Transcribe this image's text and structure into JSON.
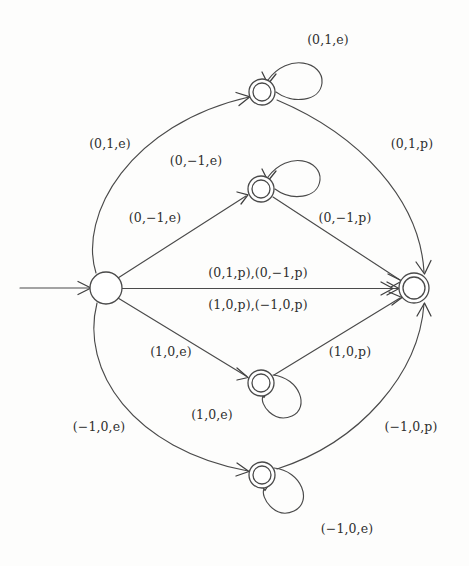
{
  "diagram": {
    "type": "state-transition-diagram",
    "colors": {
      "stroke": "#4a4a4a",
      "text": "#2f2f2f",
      "background": "#fdfdfc"
    },
    "states": [
      {
        "id": "q0",
        "name": "start-state",
        "shape": "single-circle",
        "accepting": false,
        "cx": 106,
        "cy": 288,
        "r": 16
      },
      {
        "id": "q_up2",
        "name": "state-top",
        "shape": "double-circle",
        "accepting": true,
        "cx": 262,
        "cy": 92,
        "r": 13
      },
      {
        "id": "q_up1",
        "name": "state-upper-middle",
        "shape": "double-circle",
        "accepting": true,
        "cx": 261,
        "cy": 189,
        "r": 13
      },
      {
        "id": "q_low1",
        "name": "state-lower-middle",
        "shape": "double-circle",
        "accepting": true,
        "cx": 261,
        "cy": 383,
        "r": 13
      },
      {
        "id": "q_low2",
        "name": "state-bottom",
        "shape": "double-circle",
        "accepting": true,
        "cx": 262,
        "cy": 475,
        "r": 13
      },
      {
        "id": "qf",
        "name": "state-final-right",
        "shape": "double-circle",
        "accepting": true,
        "cx": 414,
        "cy": 288,
        "r": 15
      }
    ],
    "labels": {
      "loop_top": "(0,1,e)",
      "arc_top_left": "(0,1,e)",
      "arc_top_right": "(0,1,p)",
      "loop_upper_middle": "(0,−1,e)",
      "edge_up_in": "(0,−1,e)",
      "edge_up_out": "(0,−1,p)",
      "center_upper": "(0,1,p),(0,−1,p)",
      "center_lower": "(1,0,p),(−1,0,p)",
      "edge_low_in": "(1,0,e)",
      "edge_low_out": "(1,0,p)",
      "loop_lower_middle": "(1,0,e)",
      "arc_bottom_left": "(−1,0,e)",
      "arc_bottom_right": "(−1,0,p)",
      "loop_bottom": "(−1,0,e)"
    },
    "label_positions": [
      {
        "key": "loop_top",
        "name": "label-loop-top",
        "x": 328,
        "y": 44,
        "anchor": "middle"
      },
      {
        "key": "arc_top_left",
        "name": "label-arc-top-left",
        "x": 110,
        "y": 148,
        "anchor": "middle"
      },
      {
        "key": "arc_top_right",
        "name": "label-arc-top-right",
        "x": 412,
        "y": 148,
        "anchor": "middle"
      },
      {
        "key": "loop_upper_middle",
        "name": "label-loop-upper-middle",
        "x": 196,
        "y": 165,
        "anchor": "middle"
      },
      {
        "key": "edge_up_in",
        "name": "label-edge-upper-in",
        "x": 155,
        "y": 222,
        "anchor": "middle"
      },
      {
        "key": "edge_up_out",
        "name": "label-edge-upper-out",
        "x": 345,
        "y": 222,
        "anchor": "middle"
      },
      {
        "key": "center_upper",
        "name": "label-center-upper",
        "x": 258,
        "y": 277,
        "anchor": "middle"
      },
      {
        "key": "center_lower",
        "name": "label-center-lower",
        "x": 258,
        "y": 308,
        "anchor": "middle"
      },
      {
        "key": "edge_low_in",
        "name": "label-edge-lower-in",
        "x": 171,
        "y": 356,
        "anchor": "middle"
      },
      {
        "key": "edge_low_out",
        "name": "label-edge-lower-out",
        "x": 350,
        "y": 356,
        "anchor": "middle"
      },
      {
        "key": "loop_lower_middle",
        "name": "label-loop-lower-middle",
        "x": 212,
        "y": 419,
        "anchor": "middle"
      },
      {
        "key": "arc_bottom_left",
        "name": "label-arc-bottom-left",
        "x": 99,
        "y": 431,
        "anchor": "middle"
      },
      {
        "key": "arc_bottom_right",
        "name": "label-arc-bottom-right",
        "x": 411,
        "y": 431,
        "anchor": "middle"
      },
      {
        "key": "loop_bottom",
        "name": "label-loop-bottom",
        "x": 347,
        "y": 533,
        "anchor": "middle"
      }
    ],
    "transitions": [
      {
        "name": "edge-start-to-top",
        "from": "q0",
        "to": "q_up2",
        "label_key": "arc_top_left"
      },
      {
        "name": "edge-top-to-final",
        "from": "q_up2",
        "to": "qf",
        "label_key": "arc_top_right"
      },
      {
        "name": "selfloop-top",
        "from": "q_up2",
        "to": "q_up2",
        "label_key": "loop_top"
      },
      {
        "name": "edge-start-to-upper-middle",
        "from": "q0",
        "to": "q_up1",
        "label_key": "edge_up_in"
      },
      {
        "name": "edge-upper-middle-to-final",
        "from": "q_up1",
        "to": "qf",
        "label_key": "edge_up_out"
      },
      {
        "name": "selfloop-upper-middle",
        "from": "q_up1",
        "to": "q_up1",
        "label_key": "loop_upper_middle"
      },
      {
        "name": "edge-start-to-final-direct",
        "from": "q0",
        "to": "qf",
        "label_key": "center_upper"
      },
      {
        "name": "edge-start-to-lower-middle",
        "from": "q0",
        "to": "q_low1",
        "label_key": "edge_low_in"
      },
      {
        "name": "edge-lower-middle-to-final",
        "from": "q_low1",
        "to": "qf",
        "label_key": "edge_low_out"
      },
      {
        "name": "selfloop-lower-middle",
        "from": "q_low1",
        "to": "q_low1",
        "label_key": "loop_lower_middle"
      },
      {
        "name": "edge-start-to-bottom",
        "from": "q0",
        "to": "q_low2",
        "label_key": "arc_bottom_left"
      },
      {
        "name": "edge-bottom-to-final",
        "from": "q_low2",
        "to": "qf",
        "label_key": "arc_bottom_right"
      },
      {
        "name": "selfloop-bottom",
        "from": "q_low2",
        "to": "q_low2",
        "label_key": "loop_bottom"
      }
    ]
  }
}
